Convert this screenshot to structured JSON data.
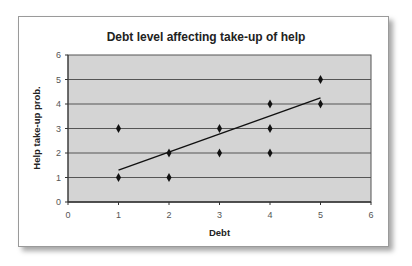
{
  "chart_data": {
    "type": "scatter",
    "title": "Debt level affecting take-up of help",
    "xlabel": "Debt",
    "ylabel": "Help take-up prob.",
    "xlim": [
      0,
      6
    ],
    "ylim": [
      0,
      6
    ],
    "x_ticks": [
      "0",
      "1",
      "2",
      "3",
      "4",
      "5",
      "6"
    ],
    "y_ticks": [
      "0",
      "1",
      "2",
      "3",
      "4",
      "5",
      "6"
    ],
    "grid": "horizontal",
    "legend": "none",
    "series": [
      {
        "name": "observations",
        "marker": "diamond",
        "points": [
          [
            1,
            3
          ],
          [
            1,
            1
          ],
          [
            2,
            2
          ],
          [
            2,
            1
          ],
          [
            3,
            3
          ],
          [
            3,
            2
          ],
          [
            4,
            4
          ],
          [
            4,
            3
          ],
          [
            4,
            2
          ],
          [
            5,
            5
          ],
          [
            5,
            4
          ]
        ]
      },
      {
        "name": "trend line",
        "type": "line",
        "points": [
          [
            1,
            1.3
          ],
          [
            5,
            4.25
          ]
        ]
      }
    ],
    "colors": {
      "plot_background": "#d4d4d4",
      "gridline": "#555555",
      "marker": "#111111",
      "trendline": "#111111"
    }
  }
}
